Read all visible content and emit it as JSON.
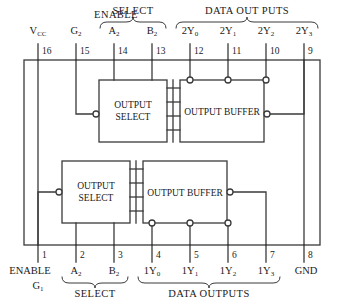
{
  "diagram": {
    "colors": {
      "line": "#3a3a3a",
      "background": "#ffffff",
      "text": "#1a1a1a"
    },
    "group_labels": {
      "top_enable": "ENABLE",
      "top_select": "SELECT",
      "top_data": "DATA OUT PUTS",
      "bottom_select": "SELECT",
      "bottom_data": "DATA OUTPUTS"
    },
    "blocks": [
      {
        "id": "output-select-top",
        "line1": "OUTPUT",
        "line2": "SELECT"
      },
      {
        "id": "output-buffer-top",
        "line1": "OUTPUT BUFFER",
        "line2": ""
      },
      {
        "id": "output-select-bottom",
        "line1": "OUTPUT",
        "line2": "SELECT"
      },
      {
        "id": "output-buffer-bottom",
        "line1": "OUTPUT BUFFER",
        "line2": ""
      }
    ],
    "pins_top": [
      {
        "number": "16",
        "name": "V",
        "sub": "CC",
        "x": 38
      },
      {
        "number": "15",
        "name": "G",
        "sub": "2",
        "x": 76
      },
      {
        "number": "14",
        "name": "A",
        "sub": "2",
        "x": 114
      },
      {
        "number": "13",
        "name": "B",
        "sub": "2",
        "x": 152
      },
      {
        "number": "12",
        "name": "2Y",
        "sub": "0",
        "x": 190
      },
      {
        "number": "11",
        "name": "2Y",
        "sub": "1",
        "x": 228
      },
      {
        "number": "10",
        "name": "2Y",
        "sub": "2",
        "x": 266
      },
      {
        "number": "9",
        "name": "2Y",
        "sub": "3",
        "x": 304
      }
    ],
    "pins_bottom": [
      {
        "number": "1",
        "name": "ENABLE",
        "name2": "G",
        "sub": "1",
        "x": 38
      },
      {
        "number": "2",
        "name": "A",
        "sub": "2",
        "x": 76
      },
      {
        "number": "3",
        "name": "B",
        "sub": "2",
        "x": 114
      },
      {
        "number": "4",
        "name": "1Y",
        "sub": "0",
        "x": 152
      },
      {
        "number": "5",
        "name": "1Y",
        "sub": "1",
        "x": 190
      },
      {
        "number": "6",
        "name": "1Y",
        "sub": "2",
        "x": 228
      },
      {
        "number": "7",
        "name": "1Y",
        "sub": "3",
        "x": 266
      },
      {
        "number": "8",
        "name": "GND",
        "sub": "",
        "x": 304
      }
    ]
  }
}
